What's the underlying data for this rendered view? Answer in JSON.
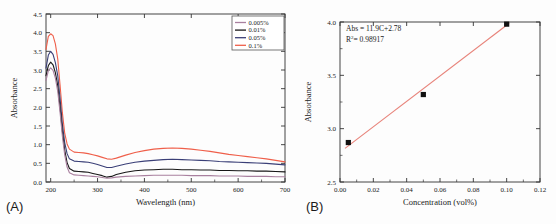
{
  "figure": {
    "panel_a_label": "(A)",
    "panel_b_label": "(B)",
    "background": "#fdfdfd"
  },
  "chart_data": [
    {
      "id": "panel-a",
      "type": "line",
      "title": "",
      "xlabel": "Wavelength (nm)",
      "ylabel": "Absorbance",
      "xlim": [
        190,
        700
      ],
      "ylim": [
        0.0,
        4.5
      ],
      "xticks": [
        200,
        300,
        400,
        500,
        600,
        700
      ],
      "xtick_labels": [
        "200",
        "300",
        "400",
        "500",
        "600",
        "700"
      ],
      "yticks": [
        0.0,
        0.5,
        1.0,
        1.5,
        2.0,
        2.5,
        3.0,
        3.5,
        4.0,
        4.5
      ],
      "ytick_labels": [
        "0.0",
        "0.5",
        "1.0",
        "1.5",
        "2.0",
        "2.5",
        "3.0",
        "3.5",
        "4.0",
        "4.5"
      ],
      "grid": false,
      "legend_position": "top-right",
      "x": [
        190,
        195,
        200,
        205,
        210,
        215,
        220,
        225,
        230,
        235,
        240,
        250,
        260,
        270,
        280,
        290,
        300,
        310,
        320,
        330,
        340,
        360,
        380,
        400,
        420,
        440,
        460,
        480,
        500,
        520,
        540,
        560,
        580,
        600,
        620,
        640,
        660,
        680,
        700
      ],
      "series": [
        {
          "name": "0.1%",
          "color": "#ef5f4a",
          "values": [
            3.55,
            3.9,
            3.97,
            3.92,
            3.7,
            3.3,
            2.6,
            1.85,
            1.3,
            1.02,
            0.88,
            0.8,
            0.79,
            0.78,
            0.76,
            0.73,
            0.7,
            0.66,
            0.62,
            0.61,
            0.64,
            0.72,
            0.79,
            0.84,
            0.88,
            0.9,
            0.91,
            0.9,
            0.88,
            0.85,
            0.82,
            0.78,
            0.74,
            0.71,
            0.68,
            0.65,
            0.62,
            0.58,
            0.54
          ]
        },
        {
          "name": "0.05%",
          "color": "#3a3f77",
          "values": [
            3.05,
            3.4,
            3.5,
            3.42,
            3.2,
            2.85,
            2.25,
            1.55,
            1.05,
            0.76,
            0.62,
            0.56,
            0.55,
            0.54,
            0.53,
            0.5,
            0.47,
            0.43,
            0.39,
            0.39,
            0.42,
            0.48,
            0.53,
            0.56,
            0.58,
            0.6,
            0.61,
            0.6,
            0.59,
            0.58,
            0.57,
            0.55,
            0.54,
            0.53,
            0.52,
            0.51,
            0.5,
            0.48,
            0.46
          ]
        },
        {
          "name": "0.01%",
          "color": "#171717",
          "values": [
            2.85,
            3.12,
            3.21,
            3.14,
            2.93,
            2.58,
            2.0,
            1.35,
            0.85,
            0.52,
            0.36,
            0.29,
            0.28,
            0.27,
            0.26,
            0.23,
            0.2,
            0.17,
            0.13,
            0.15,
            0.2,
            0.26,
            0.3,
            0.32,
            0.33,
            0.34,
            0.34,
            0.33,
            0.33,
            0.32,
            0.32,
            0.31,
            0.31,
            0.3,
            0.3,
            0.29,
            0.29,
            0.28,
            0.27
          ]
        },
        {
          "name": "0.005%",
          "color": "#a9809f",
          "values": [
            2.72,
            2.98,
            3.06,
            2.99,
            2.78,
            2.43,
            1.86,
            1.22,
            0.72,
            0.4,
            0.25,
            0.19,
            0.18,
            0.17,
            0.16,
            0.15,
            0.14,
            0.12,
            0.1,
            0.11,
            0.13,
            0.15,
            0.16,
            0.17,
            0.18,
            0.18,
            0.18,
            0.18,
            0.17,
            0.17,
            0.17,
            0.16,
            0.16,
            0.16,
            0.15,
            0.15,
            0.15,
            0.14,
            0.14
          ]
        }
      ],
      "legend": [
        {
          "label": "0.005%",
          "color": "#a9809f"
        },
        {
          "label": "0.01%",
          "color": "#171717"
        },
        {
          "label": "0.05%",
          "color": "#3a3f77"
        },
        {
          "label": "0.1%",
          "color": "#ef5f4a"
        }
      ]
    },
    {
      "id": "panel-b",
      "type": "scatter",
      "title": "",
      "xlabel": "Concentration (vol%)",
      "ylabel": "Absorbance",
      "xlim": [
        0.0,
        0.12
      ],
      "ylim": [
        2.5,
        4.0
      ],
      "xticks": [
        0.0,
        0.02,
        0.04,
        0.06,
        0.08,
        0.1,
        0.12
      ],
      "xtick_labels": [
        "0.00",
        "0.02",
        "0.04",
        "0.06",
        "0.08",
        "0.10",
        "0.12"
      ],
      "yticks": [
        2.5,
        3.0,
        3.5,
        4.0
      ],
      "ytick_labels": [
        "2.5",
        "3.0",
        "3.5",
        "4.0"
      ],
      "grid": false,
      "marker_color": "#111111",
      "fit_color": "#e8837a",
      "points": [
        {
          "x": 0.005,
          "y": 2.87
        },
        {
          "x": 0.05,
          "y": 3.32
        },
        {
          "x": 0.1,
          "y": 3.98
        }
      ],
      "fit_line": {
        "slope": 11.9,
        "intercept": 2.78,
        "x_start": 0.003,
        "x_end": 0.1015
      },
      "annotations": [
        {
          "text": "Abs = 11.9C+2.78"
        },
        {
          "text_prefix": "R",
          "text_sup": "2",
          "text_suffix": "= 0.98917"
        }
      ]
    }
  ]
}
